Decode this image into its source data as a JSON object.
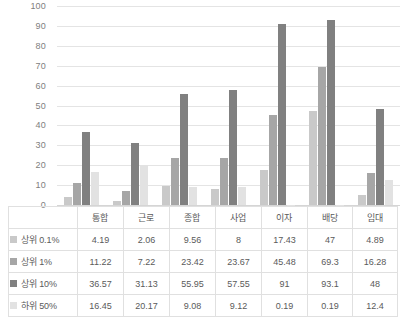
{
  "chart_data": {
    "type": "bar",
    "title": "",
    "xlabel": "",
    "ylabel": "",
    "ylim": [
      0,
      100
    ],
    "yticks": [
      100,
      90,
      80,
      70,
      60,
      50,
      40,
      30,
      20,
      10,
      0
    ],
    "grid": true,
    "legend_position": "table-left",
    "categories": [
      "통합",
      "근로",
      "종합",
      "사업",
      "이자",
      "배당",
      "임대"
    ],
    "series": [
      {
        "name": "상위 0.1%",
        "color": "#c9c9c9",
        "values": [
          4.19,
          2.06,
          9.56,
          8,
          17.43,
          47,
          4.89
        ],
        "labels": [
          "4.19",
          "2.06",
          "9.56",
          "8",
          "17.43",
          "47",
          "4.89"
        ]
      },
      {
        "name": "상위 1%",
        "color": "#a6a6a6",
        "values": [
          11.22,
          7.22,
          23.42,
          23.67,
          45.48,
          69.3,
          16.28
        ],
        "labels": [
          "11.22",
          "7.22",
          "23.42",
          "23.67",
          "45.48",
          "69.3",
          "16.28"
        ]
      },
      {
        "name": "상위 10%",
        "color": "#808080",
        "values": [
          36.57,
          31.13,
          55.95,
          57.55,
          91,
          93.1,
          48
        ],
        "labels": [
          "36.57",
          "31.13",
          "55.95",
          "57.55",
          "91",
          "93.1",
          "48"
        ]
      },
      {
        "name": "하위 50%",
        "color": "#e2e2e2",
        "values": [
          16.45,
          20.17,
          9.08,
          9.12,
          0.19,
          0.19,
          12.4
        ],
        "labels": [
          "16.45",
          "20.17",
          "9.08",
          "9.12",
          "0.19",
          "0.19",
          "12.4"
        ]
      }
    ]
  },
  "axis": {
    "tick_0": "0",
    "tick_10": "10",
    "tick_20": "20",
    "tick_30": "30",
    "tick_40": "40",
    "tick_50": "50",
    "tick_60": "60",
    "tick_70": "70",
    "tick_80": "80",
    "tick_90": "90",
    "tick_100": "100"
  },
  "table": {
    "header": [
      "",
      "통합",
      "근로",
      "종합",
      "사업",
      "이자",
      "배당",
      "임대"
    ],
    "rows": [
      {
        "label": "상위 0.1%",
        "swatch": "#c9c9c9",
        "cells": [
          "4.19",
          "2.06",
          "9.56",
          "8",
          "17.43",
          "47",
          "4.89"
        ]
      },
      {
        "label": "상위 1%",
        "swatch": "#a6a6a6",
        "cells": [
          "11.22",
          "7.22",
          "23.42",
          "23.67",
          "45.48",
          "69.3",
          "16.28"
        ]
      },
      {
        "label": "상위 10%",
        "swatch": "#808080",
        "cells": [
          "36.57",
          "31.13",
          "55.95",
          "57.55",
          "91",
          "93.1",
          "48"
        ]
      },
      {
        "label": "하위 50%",
        "swatch": "#e2e2e2",
        "cells": [
          "16.45",
          "20.17",
          "9.08",
          "9.12",
          "0.19",
          "0.19",
          "12.4"
        ]
      }
    ]
  },
  "colors": {
    "grid": "#e4e4e4",
    "axis_text": "#808080",
    "table_text": "#5a5a5a",
    "table_border": "#e0e0e0",
    "background": "#ffffff"
  }
}
